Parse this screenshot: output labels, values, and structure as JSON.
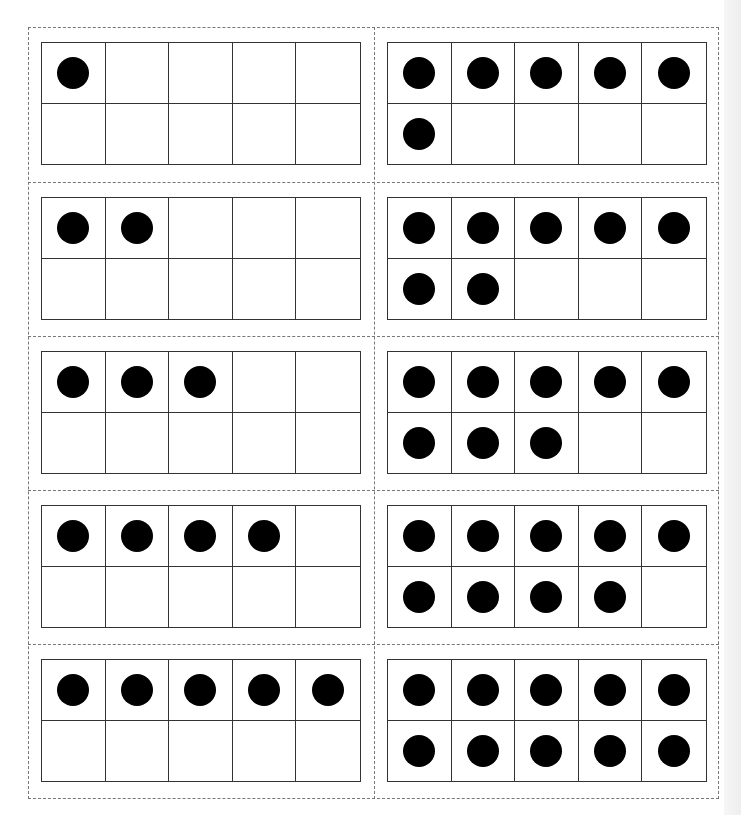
{
  "worksheet": {
    "type": "ten-frame-cards",
    "layout": {
      "columns": 2,
      "rows": 5
    },
    "colors": {
      "dot": "#000000",
      "grid_line": "#333333",
      "cut_line": "#777777",
      "background": "#ffffff"
    },
    "cards": [
      {
        "position": "row1-left",
        "count": 1
      },
      {
        "position": "row1-right",
        "count": 6
      },
      {
        "position": "row2-left",
        "count": 2
      },
      {
        "position": "row2-right",
        "count": 7
      },
      {
        "position": "row3-left",
        "count": 3
      },
      {
        "position": "row3-right",
        "count": 8
      },
      {
        "position": "row4-left",
        "count": 4
      },
      {
        "position": "row4-right",
        "count": 9
      },
      {
        "position": "row5-left",
        "count": 5
      },
      {
        "position": "row5-right",
        "count": 10
      }
    ],
    "icons": {
      "counter": "filled-circle-dot"
    }
  }
}
